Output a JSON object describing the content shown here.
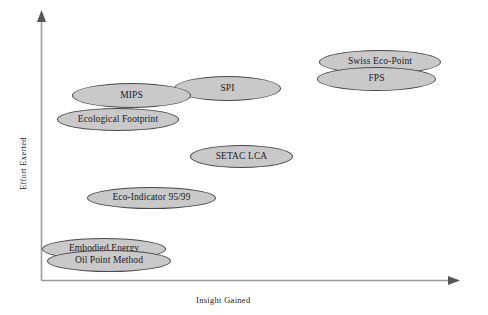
{
  "figure": {
    "background_color": "#ffffff",
    "bubble_fill": "#c9c9c9",
    "bubble_stroke": "#4a4a4a",
    "axis_color": "#9b9b9b"
  },
  "axes": {
    "y_title": "Effort Exerted",
    "x_title": "Insight Gained"
  },
  "chart_data": {
    "type": "scatter",
    "title": "",
    "xlabel": "Insight Gained",
    "ylabel": "Effort Exerted",
    "grid": false,
    "legend": "none",
    "axis_style": "qualitative-arrows",
    "xlim": [
      0,
      1
    ],
    "ylim": [
      0,
      1
    ],
    "note": "Qualitative bubble positioning chart: no numeric tick labels are printed on either axis; values below are normalized positions read off the plotting box.",
    "points": [
      {
        "label": "Swiss Eco-Point",
        "x": 0.68,
        "y": 0.82
      },
      {
        "label": "FPS",
        "x": 0.67,
        "y": 0.76
      },
      {
        "label": "SPI",
        "x": 0.54,
        "y": 0.72
      },
      {
        "label": "MIPS",
        "x": 0.28,
        "y": 0.69
      },
      {
        "label": "Ecological Footprint",
        "x": 0.23,
        "y": 0.6
      },
      {
        "label": "SETAC LCA",
        "x": 0.51,
        "y": 0.48
      },
      {
        "label": "Eco-Indicator 95/99",
        "x": 0.36,
        "y": 0.31
      },
      {
        "label": "Embodied Energy",
        "x": 0.24,
        "y": 0.12
      },
      {
        "label": "Oil Point Method",
        "x": 0.26,
        "y": 0.07
      }
    ]
  },
  "bubbles": [
    {
      "label": "Swiss Eco-Point",
      "left": 319,
      "top": 50,
      "width": 122,
      "height": 24
    },
    {
      "label": "FPS",
      "left": 317,
      "top": 67,
      "width": 119,
      "height": 24
    },
    {
      "label": "SPI",
      "left": 174,
      "top": 76,
      "width": 107,
      "height": 25
    },
    {
      "label": "MIPS",
      "left": 72,
      "top": 83,
      "width": 119,
      "height": 25
    },
    {
      "label": "Ecological Footprint",
      "left": 57,
      "top": 108,
      "width": 122,
      "height": 23
    },
    {
      "label": "SETAC LCA",
      "left": 190,
      "top": 145,
      "width": 103,
      "height": 23
    },
    {
      "label": "Eco-Indicator 95/99",
      "left": 87,
      "top": 187,
      "width": 129,
      "height": 22
    },
    {
      "label": "Embodied Energy",
      "left": 42,
      "top": 238,
      "width": 124,
      "height": 22
    },
    {
      "label": "Oil Point Method",
      "left": 47,
      "top": 250,
      "width": 124,
      "height": 22
    }
  ]
}
